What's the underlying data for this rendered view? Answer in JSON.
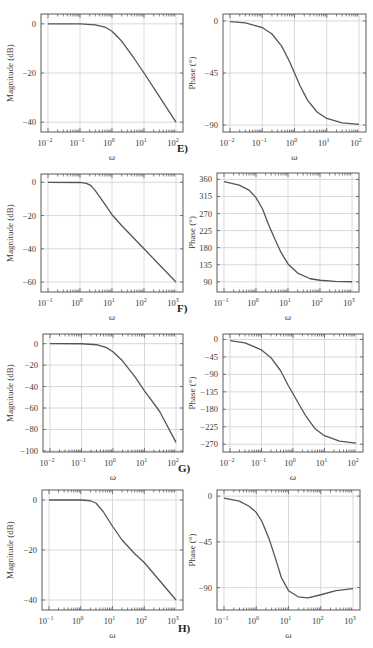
{
  "chart_data": [
    {
      "id": "E-magnitude",
      "figure": "E)",
      "type": "line",
      "xlabel": "ω",
      "ylabel": "Magnitude (dB)",
      "xscale": "log",
      "xlim": [
        0.01,
        100
      ],
      "ylim": [
        -44,
        4
      ],
      "xticks": [
        0.01,
        0.1,
        1,
        10,
        100
      ],
      "xtick_labels": [
        "10^-2",
        "10^-1",
        "10^0",
        "10^1",
        "10^2"
      ],
      "yticks": [
        0,
        -20,
        -40
      ],
      "ytick_labels": [
        "0",
        "−20",
        "−40"
      ],
      "grid": true,
      "x": [
        0.01,
        0.1,
        0.3,
        0.6,
        1,
        2,
        5,
        10,
        30,
        100
      ],
      "y": [
        0,
        -0.04,
        -0.4,
        -1.3,
        -3,
        -7,
        -14.2,
        -20,
        -29.5,
        -40
      ]
    },
    {
      "id": "E-phase",
      "figure": "E)",
      "type": "line",
      "xlabel": "ω",
      "ylabel": "Phase (°)",
      "xscale": "log",
      "xlim": [
        0.01,
        100
      ],
      "ylim": [
        -96,
        6
      ],
      "xticks": [
        0.01,
        0.1,
        1,
        10,
        100
      ],
      "xtick_labels": [
        "10^-2",
        "10^-1",
        "10^0",
        "10^1",
        "10^2"
      ],
      "yticks": [
        0,
        -45,
        -90
      ],
      "ytick_labels": [
        "0",
        "−45",
        "−90"
      ],
      "grid": true,
      "x": [
        0.01,
        0.03,
        0.1,
        0.2,
        0.4,
        0.7,
        1,
        1.5,
        2.5,
        5,
        10,
        30,
        100
      ],
      "y": [
        -0.6,
        -1.7,
        -5.7,
        -11.3,
        -21.8,
        -35,
        -45,
        -56.3,
        -68.2,
        -78.7,
        -84.3,
        -88.1,
        -89.4
      ]
    },
    {
      "id": "F-magnitude",
      "figure": "F)",
      "type": "line",
      "xlabel": "ω",
      "ylabel": "Magnitude (dB)",
      "xscale": "log",
      "xlim": [
        0.1,
        1000
      ],
      "ylim": [
        -66,
        5
      ],
      "xticks": [
        0.1,
        1,
        10,
        100,
        1000
      ],
      "xtick_labels": [
        "10^-1",
        "10^0",
        "10^1",
        "10^2",
        "10^3"
      ],
      "yticks": [
        0,
        -20,
        -40,
        -60
      ],
      "ytick_labels": [
        "0",
        "−20",
        "−40",
        "−60"
      ],
      "grid": true,
      "x": [
        0.1,
        1,
        1.6,
        2.2,
        3,
        5,
        10,
        20,
        100,
        1000
      ],
      "y": [
        0,
        -0.1,
        -0.6,
        -2,
        -5,
        -11,
        -19.5,
        -26,
        -40,
        -60
      ]
    },
    {
      "id": "F-phase",
      "figure": "F)",
      "type": "line",
      "xlabel": "ω",
      "ylabel": "Phase (°)",
      "xscale": "log",
      "xlim": [
        0.1,
        1000
      ],
      "ylim": [
        63,
        377
      ],
      "xticks": [
        0.1,
        1,
        10,
        100,
        1000
      ],
      "xtick_labels": [
        "10^-1",
        "10^0",
        "10^1",
        "10^2",
        "10^3"
      ],
      "yticks": [
        360,
        315,
        270,
        225,
        180,
        135,
        90
      ],
      "ytick_labels": [
        "360",
        "315",
        "270",
        "225",
        "180",
        "135",
        "90"
      ],
      "grid": true,
      "x": [
        0.1,
        0.3,
        0.6,
        1,
        1.6,
        2.5,
        4,
        6,
        10,
        20,
        50,
        100,
        300,
        1000
      ],
      "y": [
        354,
        345,
        332,
        312,
        282,
        240,
        200,
        168,
        137,
        113,
        98,
        94,
        91,
        90
      ]
    },
    {
      "id": "G-magnitude",
      "figure": "G)",
      "type": "line",
      "xlabel": "ω",
      "ylabel": "Magnitude (dB)",
      "xscale": "log",
      "xlim": [
        0.01,
        100
      ],
      "ylim": [
        -101,
        9
      ],
      "xticks": [
        0.01,
        0.1,
        1,
        10,
        100
      ],
      "xtick_labels": [
        "10^-2",
        "10^-1",
        "10^0",
        "10^1",
        "10^2"
      ],
      "yticks": [
        0,
        -20,
        -40,
        -60,
        -80,
        -100
      ],
      "ytick_labels": [
        "0",
        "−20",
        "−40",
        "−60",
        "−80",
        "−100"
      ],
      "grid": true,
      "x": [
        0.01,
        0.1,
        0.3,
        0.6,
        1,
        2,
        5,
        10,
        30,
        100
      ],
      "y": [
        0,
        -0.1,
        -1,
        -3.5,
        -7.5,
        -16,
        -31,
        -44,
        -63,
        -92
      ]
    },
    {
      "id": "G-phase",
      "figure": "G)",
      "type": "line",
      "xlabel": "ω",
      "ylabel": "Phase (°)",
      "xscale": "log",
      "xlim": [
        0.01,
        100
      ],
      "ylim": [
        -290,
        14
      ],
      "xticks": [
        0.01,
        0.1,
        1,
        10,
        100
      ],
      "xtick_labels": [
        "10^-2",
        "10^-1",
        "10^0",
        "10^1",
        "10^2"
      ],
      "yticks": [
        0,
        -45,
        -90,
        -135,
        -180,
        -225,
        -270
      ],
      "ytick_labels": [
        "0",
        "−45",
        "−90",
        "−135",
        "−180",
        "−225",
        "−270"
      ],
      "grid": true,
      "x": [
        0.01,
        0.03,
        0.1,
        0.2,
        0.4,
        0.7,
        1,
        1.5,
        2.5,
        5,
        10,
        30,
        100
      ],
      "y": [
        -3,
        -9,
        -27,
        -47,
        -80,
        -118,
        -140,
        -165,
        -196,
        -230,
        -248,
        -262,
        -267
      ]
    },
    {
      "id": "H-magnitude",
      "figure": "H)",
      "type": "line",
      "xlabel": "ω",
      "ylabel": "Magnitude (dB)",
      "xscale": "log",
      "xlim": [
        0.1,
        1000
      ],
      "ylim": [
        -44,
        4
      ],
      "xticks": [
        0.1,
        1,
        10,
        100,
        1000
      ],
      "xtick_labels": [
        "10^-1",
        "10^0",
        "10^1",
        "10^2",
        "10^3"
      ],
      "yticks": [
        0,
        -20,
        -40
      ],
      "ytick_labels": [
        "0",
        "−20",
        "−40"
      ],
      "grid": true,
      "x": [
        0.1,
        1,
        2,
        3,
        5,
        10,
        20,
        50,
        100,
        1000
      ],
      "y": [
        0,
        0,
        -0.3,
        -1.2,
        -4.5,
        -10.5,
        -16,
        -21.5,
        -25,
        -40
      ]
    },
    {
      "id": "H-phase",
      "figure": "H)",
      "type": "line",
      "xlabel": "ω",
      "ylabel": "Phase (°)",
      "xscale": "log",
      "xlim": [
        0.1,
        1000
      ],
      "ylim": [
        -112,
        6
      ],
      "xticks": [
        0.1,
        1,
        10,
        100,
        1000
      ],
      "xtick_labels": [
        "10^-1",
        "10^0",
        "10^1",
        "10^2",
        "10^3"
      ],
      "yticks": [
        0,
        -45,
        -90
      ],
      "ytick_labels": [
        "0",
        "−45",
        "−90"
      ],
      "grid": true,
      "x": [
        0.1,
        0.3,
        0.6,
        1,
        1.5,
        2.5,
        4,
        6,
        10,
        20,
        40,
        100,
        300,
        1000
      ],
      "y": [
        -2,
        -5,
        -10,
        -16,
        -25,
        -42,
        -62,
        -80,
        -93,
        -99,
        -100,
        -97,
        -93,
        -91
      ]
    }
  ],
  "labels": {
    "E": "E)",
    "F": "F)",
    "G": "G)",
    "H": "H)"
  },
  "colors": {
    "line": "#555555",
    "grid": "#cfcfcf",
    "frame": "#4a4a4a",
    "text": "#333333"
  }
}
